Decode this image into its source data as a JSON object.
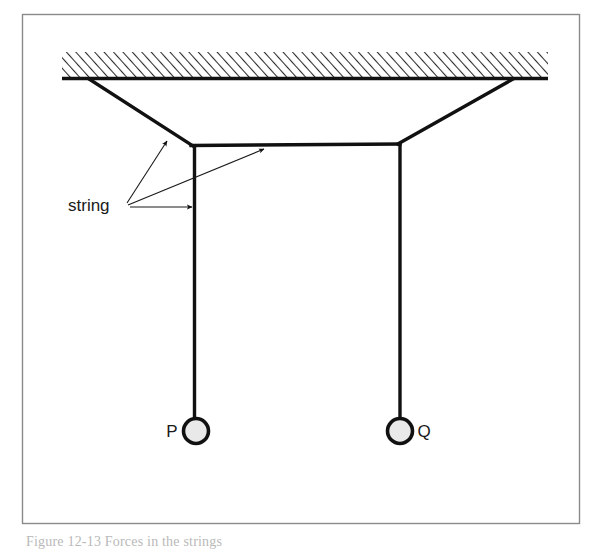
{
  "figure": {
    "background_color": "#ffffff",
    "ink_color": "#1a1a1a",
    "frame": {
      "name": "figure-border",
      "x": 22,
      "y": 14,
      "width": 558,
      "height": 510,
      "stroke": "#8a8a8a",
      "stroke_width": 1.4
    },
    "ceiling": {
      "label": "ceiling-support",
      "x_left": 62,
      "x_right": 548,
      "y_top": 52,
      "y_bottom": 79,
      "hatch_color": "#2a2a2a",
      "baseline_stroke": "#111111",
      "baseline_width": 3.2,
      "hatch_direction": "lean-right"
    },
    "strings": [
      {
        "name": "left-diagonal-string",
        "from": [
          90,
          79
        ],
        "to": [
          192,
          146
        ]
      },
      {
        "name": "right-diagonal-string",
        "from": [
          513,
          79
        ],
        "to": [
          399,
          144
        ]
      },
      {
        "name": "horizontal-string",
        "from": [
          192,
          146
        ],
        "to": [
          399,
          144
        ]
      },
      {
        "name": "vertical-string-p",
        "from": [
          194,
          146
        ],
        "to": [
          194,
          420
        ]
      },
      {
        "name": "vertical-string-q",
        "from": [
          400,
          144
        ],
        "to": [
          400,
          420
        ]
      }
    ],
    "string_stroke": "#111111",
    "string_width": 3.4,
    "masses": [
      {
        "name": "mass-p",
        "label": "P",
        "cx": 196,
        "cy": 431,
        "r": 12.5,
        "label_x": 172,
        "label_y": 437,
        "label_anchor": "middle",
        "fill": "#e9e9e9",
        "stroke": "#111111",
        "stroke_width": 3.6
      },
      {
        "name": "mass-q",
        "label": "Q",
        "cx": 400,
        "cy": 431,
        "r": 12.5,
        "label_x": 424,
        "label_y": 437,
        "label_anchor": "middle",
        "fill": "#e9e9e9",
        "stroke": "#111111",
        "stroke_width": 3.6
      }
    ],
    "annotation": {
      "name": "string-callout",
      "text": "string",
      "text_x": 68,
      "text_y": 210,
      "origin": [
        126,
        204
      ],
      "leader_stroke": "#1a1a1a",
      "leader_width": 1.1,
      "arrows": [
        {
          "name": "arrow-to-left-diagonal-string",
          "from": [
            127,
            202
          ],
          "to": [
            166,
            140
          ]
        },
        {
          "name": "arrow-to-horizontal-string",
          "from": [
            128,
            205
          ],
          "to": [
            262,
            148
          ]
        },
        {
          "name": "arrow-to-vertical-string",
          "from": [
            130,
            207
          ],
          "to": [
            191,
            207
          ]
        }
      ]
    },
    "caption": {
      "name": "figure-caption",
      "text": "Figure 12-13   Forces in the strings",
      "clipped": true
    }
  }
}
